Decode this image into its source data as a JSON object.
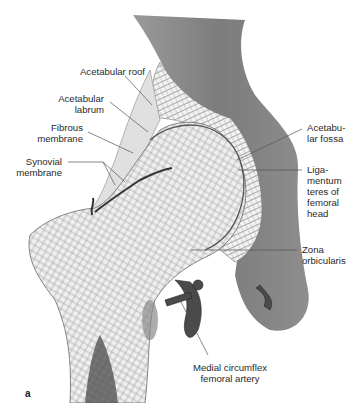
{
  "figure": {
    "panel_label": "a",
    "labels": {
      "acetabular_roof": "Acetabular roof",
      "acetabular_labrum_1": "Acetabular",
      "acetabular_labrum_2": "labrum",
      "fibrous_membrane_1": "Fibrous",
      "fibrous_membrane_2": "membrane",
      "synovial_membrane_1": "Synovial",
      "synovial_membrane_2": "membrane",
      "acetabular_fossa_1": "Acetabu-",
      "acetabular_fossa_2": "lar fossa",
      "ligamentum_1": "Liga-",
      "ligamentum_2": "mentum",
      "ligamentum_3": "teres of",
      "ligamentum_4": "femoral",
      "ligamentum_5": "head",
      "zona_1": "Zona",
      "zona_2": "orbicularis",
      "medial_circumflex_1": "Medial circumflex",
      "medial_circumflex_2": "femoral artery"
    }
  }
}
